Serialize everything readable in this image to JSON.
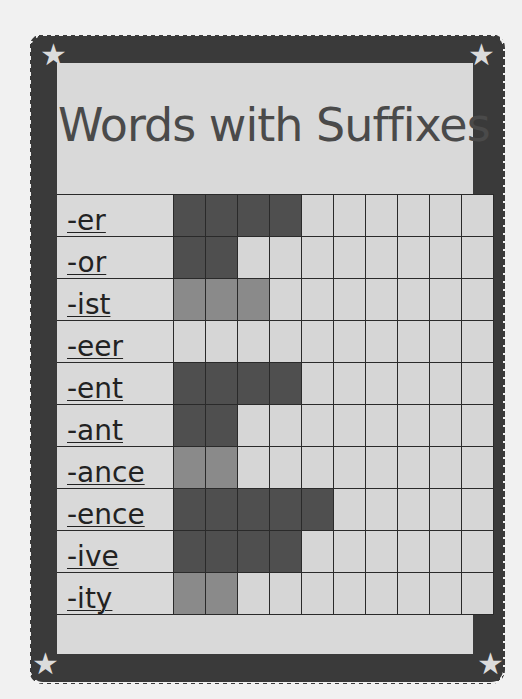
{
  "title": "Words with Suffixes",
  "decorations": {
    "corner_icons": [
      "star-icon",
      "star-icon",
      "star-icon",
      "star-icon"
    ]
  },
  "colors": {
    "border": "#3a3a3a",
    "panel": "#d9d9d9",
    "dark_fill": "#4f4f4f",
    "mid_fill": "#8a8a8a",
    "empty": "#d6d6d6"
  },
  "grid": {
    "columns": 10
  },
  "chart_data": {
    "type": "bar",
    "title": "Words with Suffixes",
    "orientation": "horizontal",
    "categories": [
      "-er",
      "-or",
      "-ist",
      "-eer",
      "-ent",
      "-ant",
      "-ance",
      "-ence",
      "-ive",
      "-ity"
    ],
    "values": [
      4,
      2,
      3,
      0,
      4,
      2,
      2,
      5,
      4,
      2
    ],
    "shade": [
      "dark",
      "dark",
      "mid",
      "none",
      "dark",
      "dark",
      "mid",
      "dark",
      "dark",
      "mid"
    ],
    "xlabel": "",
    "ylabel": "",
    "xlim": [
      0,
      10
    ],
    "grid": true
  }
}
